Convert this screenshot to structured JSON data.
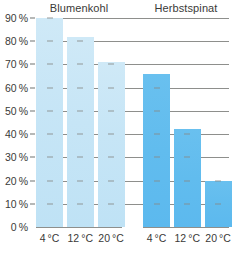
{
  "chart_data": {
    "type": "bar",
    "title": "",
    "xlabel": "",
    "ylabel": "",
    "ylim": [
      0,
      90
    ],
    "grid": true,
    "legend": "none",
    "categories": [
      "4 °C",
      "12 °C",
      "20 °C"
    ],
    "ytick_labels": [
      "0 %",
      "10 %",
      "20 %",
      "30 %",
      "40 %",
      "50 %",
      "60 %",
      "70 %",
      "80 %",
      "90 %"
    ],
    "ytick_values": [
      0,
      10,
      20,
      30,
      40,
      50,
      60,
      70,
      80,
      90
    ],
    "panels": [
      {
        "name": "Blumenkohl",
        "color": "#c6e5f6",
        "categories": [
          "4 °C",
          "12 °C",
          "20 °C"
        ],
        "values": [
          90,
          82,
          71
        ]
      },
      {
        "name": "Herbstspinat",
        "color": "#61bcee",
        "categories": [
          "4 °C",
          "12 °C",
          "20 °C"
        ],
        "values": [
          66,
          42,
          20
        ]
      }
    ],
    "series": [
      {
        "name": "Blumenkohl",
        "values": [
          90,
          82,
          71
        ]
      },
      {
        "name": "Herbstspinat",
        "values": [
          66,
          42,
          20
        ]
      }
    ]
  },
  "panels": {
    "left": {
      "title": "Blumenkohl"
    },
    "right": {
      "title": "Herbstspinat"
    }
  },
  "axis": {
    "y": {
      "labels": [
        "90 %",
        "80 %",
        "70 %",
        "60 %",
        "50 %",
        "40 %",
        "30 %",
        "20 %",
        "10 %",
        "0 %"
      ]
    },
    "x": {
      "left": [
        "4 °C",
        "12 °C",
        "20 °C"
      ],
      "right": [
        "4 °C",
        "12 °C",
        "20 °C"
      ]
    }
  },
  "colors": {
    "bar_light": "#c6e5f6",
    "bar_dark": "#61bcee",
    "grid": "#8e8f8c",
    "text": "#3a3a38",
    "background": "#ffffff"
  }
}
